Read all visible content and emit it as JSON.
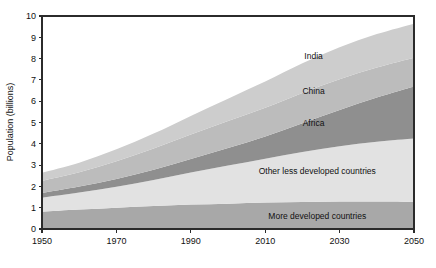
{
  "chart_data": {
    "type": "area",
    "stacked": true,
    "title": "",
    "subtitle": "",
    "xlabel": "",
    "ylabel": "Population (billions)",
    "xlim": [
      1950,
      2050
    ],
    "ylim": [
      0,
      10
    ],
    "grid": false,
    "legend_position": "inline-annotations",
    "xticks": [
      1950,
      1970,
      1990,
      2010,
      2030,
      2050
    ],
    "xtick_labels": [
      "1950",
      "1970",
      "1990",
      "2010",
      "2030",
      "2050"
    ],
    "yticks": [
      0,
      1,
      2,
      3,
      4,
      5,
      6,
      7,
      8,
      9,
      10
    ],
    "ytick_labels": [
      "0",
      "1",
      "2",
      "3",
      "4",
      "5",
      "6",
      "7",
      "8",
      "9",
      "10"
    ],
    "x": [
      1950,
      1960,
      1970,
      1980,
      1990,
      2000,
      2010,
      2020,
      2030,
      2040,
      2050
    ],
    "series": [
      {
        "name": "More developed countries",
        "color": "#a8a8a8",
        "values": [
          0.81,
          0.91,
          1.0,
          1.08,
          1.15,
          1.19,
          1.24,
          1.27,
          1.29,
          1.29,
          1.28
        ],
        "label_x": 2024,
        "label_y": 0.6
      },
      {
        "name": "Other less developed countries",
        "color": "#e2e2e2",
        "values": [
          0.66,
          0.8,
          0.98,
          1.22,
          1.5,
          1.79,
          2.06,
          2.35,
          2.6,
          2.81,
          2.97
        ],
        "label_x": 2024,
        "label_y": 2.7
      },
      {
        "name": "Africa",
        "color": "#8f8f8f",
        "values": [
          0.23,
          0.29,
          0.37,
          0.48,
          0.64,
          0.82,
          1.04,
          1.35,
          1.7,
          2.07,
          2.44
        ],
        "label_x": 2023,
        "label_y": 5.0
      },
      {
        "name": "China",
        "color": "#bcbcbc",
        "values": [
          0.56,
          0.66,
          0.83,
          1.0,
          1.15,
          1.27,
          1.35,
          1.42,
          1.44,
          1.41,
          1.35
        ],
        "label_x": 2023,
        "label_y": 6.5
      },
      {
        "name": "India",
        "color": "#cdcdcd",
        "values": [
          0.38,
          0.45,
          0.56,
          0.7,
          0.87,
          1.05,
          1.23,
          1.39,
          1.5,
          1.57,
          1.6
        ],
        "label_x": 2023,
        "label_y": 8.1
      }
    ],
    "totals_note": "",
    "axis_color": "#2b2b2b",
    "plot_background": "#ffffff"
  },
  "plot_geometry": {
    "left": 42,
    "right": 414,
    "top": 16,
    "bottom": 229
  }
}
